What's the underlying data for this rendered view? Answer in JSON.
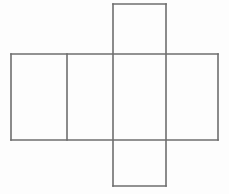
{
  "figure": {
    "name": "cuboid-net",
    "background_color": "#fdfdfd",
    "stroke_color": "#6e6e6e",
    "stroke_width": 1.6,
    "canvas": {
      "width": 229,
      "height": 194
    }
  },
  "geometry": {
    "band": {
      "x1": 11,
      "y1": 54,
      "x2": 218,
      "y2": 140
    },
    "vertical_dividers": [
      67,
      113,
      166
    ],
    "top_flap": {
      "x1": 113,
      "y1": 4,
      "x2": 166,
      "y2": 54
    },
    "bottom_flap": {
      "x1": 113,
      "y1": 140,
      "x2": 166,
      "y2": 186
    }
  },
  "faces": [
    {
      "id": "face-left-end",
      "label": "",
      "x": 11,
      "y": 54,
      "width": 56,
      "height": 86
    },
    {
      "id": "face-front",
      "label": "",
      "x": 67,
      "y": 54,
      "width": 46,
      "height": 86
    },
    {
      "id": "face-center",
      "label": "",
      "x": 113,
      "y": 54,
      "width": 53,
      "height": 86
    },
    {
      "id": "face-right-end",
      "label": "",
      "x": 166,
      "y": 54,
      "width": 52,
      "height": 86
    },
    {
      "id": "face-top-flap",
      "label": "",
      "x": 113,
      "y": 4,
      "width": 53,
      "height": 50
    },
    {
      "id": "face-bottom-flap",
      "label": "",
      "x": 113,
      "y": 140,
      "width": 53,
      "height": 46
    }
  ],
  "edges": {
    "horizontal": [
      {
        "id": "edge-band-top",
        "x1": 11,
        "y1": 54,
        "x2": 218,
        "y2": 54
      },
      {
        "id": "edge-band-bottom",
        "x1": 11,
        "y1": 140,
        "x2": 218,
        "y2": 140
      },
      {
        "id": "edge-top-flap-top",
        "x1": 113,
        "y1": 4,
        "x2": 166,
        "y2": 4
      },
      {
        "id": "edge-bottom-flap-bottom",
        "x1": 113,
        "y1": 186,
        "x2": 166,
        "y2": 186
      }
    ],
    "vertical": [
      {
        "id": "edge-band-left",
        "x1": 11,
        "y1": 54,
        "x2": 11,
        "y2": 140
      },
      {
        "id": "edge-band-right",
        "x1": 218,
        "y1": 54,
        "x2": 218,
        "y2": 140
      },
      {
        "id": "edge-divider-1",
        "x1": 67,
        "y1": 54,
        "x2": 67,
        "y2": 140
      },
      {
        "id": "edge-divider-2",
        "x1": 113,
        "y1": 4,
        "x2": 113,
        "y2": 186
      },
      {
        "id": "edge-divider-3",
        "x1": 166,
        "y1": 4,
        "x2": 166,
        "y2": 186
      }
    ]
  }
}
